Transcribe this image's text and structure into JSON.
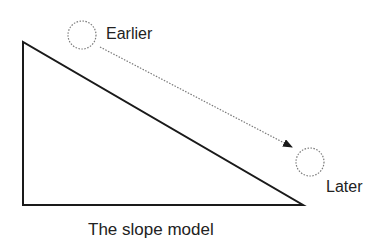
{
  "diagram": {
    "caption": "The slope model",
    "labels": {
      "earlier": "Earlier",
      "later": "Later"
    },
    "colors": {
      "stroke": "#1a1a1a",
      "dotted": "#7a7a7a",
      "text": "#222222",
      "background": "#ffffff"
    },
    "shapes": {
      "triangle": {
        "points": [
          [
            23,
            42
          ],
          [
            23,
            205
          ],
          [
            303,
            205
          ]
        ]
      },
      "earlier_circle": {
        "cx": 82,
        "cy": 35,
        "r": 14,
        "style": "dotted"
      },
      "later_circle": {
        "cx": 310,
        "cy": 162,
        "r": 14,
        "style": "dotted"
      },
      "arrow": {
        "from": [
          100,
          47
        ],
        "to": [
          292,
          147
        ],
        "style": "dotted",
        "head": "filled-triangle"
      }
    }
  }
}
